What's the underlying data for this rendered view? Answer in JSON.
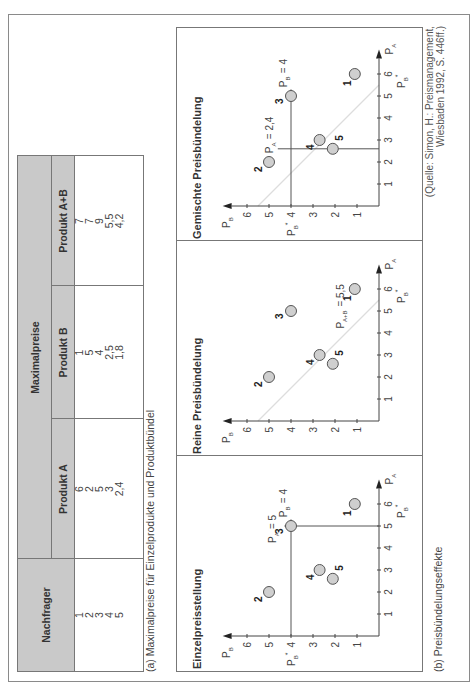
{
  "table": {
    "header_group": "Maximalpreise",
    "col_nachfrager": "Nachfrager",
    "col_a": "Produkt A",
    "col_b": "Produkt B",
    "col_ab": "Produkt A+B",
    "rows": [
      {
        "nachfrager": "1",
        "a": "6",
        "b": "1",
        "ab": "7"
      },
      {
        "nachfrager": "2",
        "a": "2",
        "b": "5",
        "ab": "7"
      },
      {
        "nachfrager": "3",
        "a": "5",
        "b": "4",
        "ab": "9"
      },
      {
        "nachfrager": "4",
        "a": "3",
        "b": "2,5",
        "ab": "5,5"
      },
      {
        "nachfrager": "5",
        "a": "2,4",
        "b": "1,8",
        "ab": "4,2"
      }
    ]
  },
  "caption_a": "(a) Maximalpreise für Einzelprodukte und Produktbündel",
  "caption_b": "(b) Preisbündelungseffekte",
  "source": {
    "line1": "(Quelle: Simon, H.: Preismanagement,",
    "line2": "Wiesbaden 1992, S. 446ff.)"
  },
  "panels": [
    {
      "title": "Einzelpreisstellung"
    },
    {
      "title": "Reine Preisbündelung"
    },
    {
      "title": "Gemischte Preisbündelung"
    }
  ],
  "colors": {
    "header_fill": "#c9c9c9",
    "point_fill": "#cfcfcf",
    "point_stroke": "#555555",
    "axis": "#444444",
    "diagonal": "#dddddd"
  },
  "chart_data": [
    {
      "type": "scatter",
      "title": "Einzelpreisstellung",
      "xlabel": "P_A",
      "ylabel": "P_B",
      "xlim": [
        0,
        6
      ],
      "ylim": [
        0,
        6
      ],
      "x_ticks": [
        1,
        2,
        3,
        4,
        5,
        6
      ],
      "y_ticks": [
        1,
        2,
        3,
        4,
        5,
        6
      ],
      "points": [
        {
          "label": "1",
          "x": 6,
          "y": 1.1
        },
        {
          "label": "2",
          "x": 2,
          "y": 5
        },
        {
          "label": "3",
          "x": 5,
          "y": 4
        },
        {
          "label": "4",
          "x": 3,
          "y": 2.7
        },
        {
          "label": "5",
          "x": 2.6,
          "y": 2.1
        }
      ],
      "annotations": [
        "P_A = 5",
        "P_B = 4",
        "P_B*",
        "P_B*"
      ],
      "reference_lines": [
        {
          "type": "vertical",
          "x": 5
        },
        {
          "type": "horizontal",
          "y": 4
        }
      ]
    },
    {
      "type": "scatter",
      "title": "Reine Preisbündelung",
      "xlabel": "P_A",
      "ylabel": "P_B",
      "xlim": [
        0,
        6
      ],
      "ylim": [
        0,
        6
      ],
      "x_ticks": [
        1,
        2,
        3,
        4,
        5,
        6
      ],
      "y_ticks": [
        1,
        2,
        3,
        4,
        5,
        6
      ],
      "points": [
        {
          "label": "1",
          "x": 6,
          "y": 1.1
        },
        {
          "label": "2",
          "x": 2,
          "y": 5
        },
        {
          "label": "3",
          "x": 5,
          "y": 4
        },
        {
          "label": "4",
          "x": 3,
          "y": 2.7
        },
        {
          "label": "5",
          "x": 2.6,
          "y": 2.1
        }
      ],
      "annotations": [
        "P_A+B = 5,5",
        "P_B*"
      ],
      "reference_lines": [
        {
          "type": "diagonal",
          "sum": 5.5
        }
      ]
    },
    {
      "type": "scatter",
      "title": "Gemischte Preisbündelung",
      "xlabel": "P_A",
      "ylabel": "P_B",
      "xlim": [
        0,
        6
      ],
      "ylim": [
        0,
        6
      ],
      "x_ticks": [
        1,
        2,
        3,
        4,
        5,
        6
      ],
      "y_ticks": [
        1,
        2,
        3,
        4,
        5,
        6
      ],
      "points": [
        {
          "label": "1",
          "x": 6,
          "y": 1.1
        },
        {
          "label": "2",
          "x": 2,
          "y": 5
        },
        {
          "label": "3",
          "x": 5,
          "y": 4
        },
        {
          "label": "4",
          "x": 3,
          "y": 2.7
        },
        {
          "label": "5",
          "x": 2.6,
          "y": 2.1
        }
      ],
      "annotations": [
        "P_A = 2,4",
        "P_B = 4",
        "P_B*",
        "P_B*"
      ],
      "reference_lines": [
        {
          "type": "vertical",
          "x": 2.6
        },
        {
          "type": "horizontal",
          "y": 4
        },
        {
          "type": "diagonal",
          "sum": 5.5
        }
      ]
    }
  ]
}
